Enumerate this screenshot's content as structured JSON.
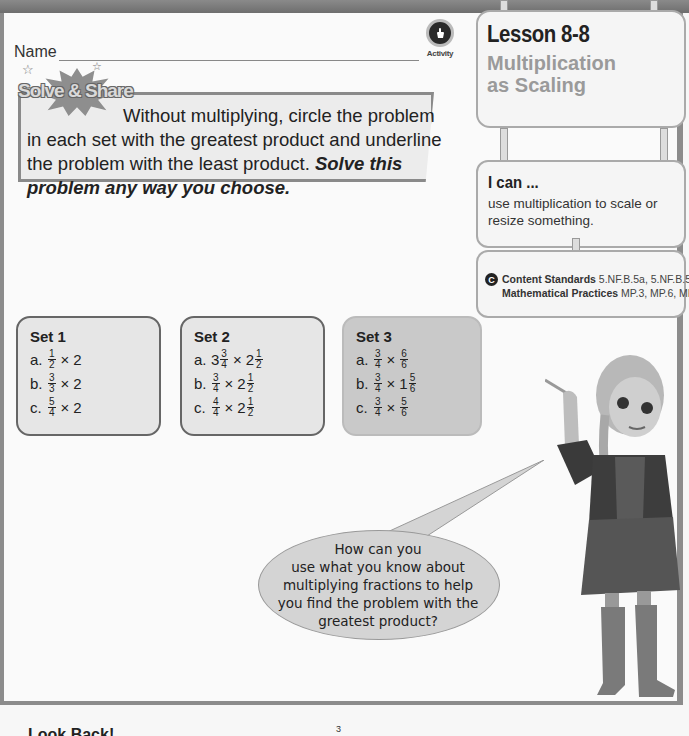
{
  "header": {
    "name_label": "Name",
    "activity_label": "Activity",
    "activity_icon": "hand-pointer-icon"
  },
  "solve_share": {
    "badge": "Solve & Share",
    "prompt_line1": "Without multiplying, circle the problem",
    "prompt_rest": "in each set with the greatest product and underline the problem with the least product.",
    "prompt_bold": "Solve this problem any way you choose."
  },
  "lesson": {
    "number": "Lesson 8-8",
    "title_line1": "Multiplication",
    "title_line2": "as Scaling"
  },
  "i_can": {
    "title": "I can ...",
    "text": "use multiplication to scale or resize something."
  },
  "standards": {
    "icon": "C",
    "content_label": "Content Standards",
    "content_value": "5.NF.B.5a, 5.NF.B.5b",
    "practices_label": "Mathematical Practices",
    "practices_value": "MP.3, MP.6, MP.7"
  },
  "sets": [
    {
      "title": "Set 1",
      "problems": [
        {
          "label": "a.",
          "whole1": "",
          "num1": "1",
          "den1": "2",
          "op": "×",
          "whole2": "2",
          "num2": "",
          "den2": ""
        },
        {
          "label": "b.",
          "whole1": "",
          "num1": "3",
          "den1": "3",
          "op": "×",
          "whole2": "2",
          "num2": "",
          "den2": ""
        },
        {
          "label": "c.",
          "whole1": "",
          "num1": "5",
          "den1": "4",
          "op": "×",
          "whole2": "2",
          "num2": "",
          "den2": ""
        }
      ]
    },
    {
      "title": "Set 2",
      "problems": [
        {
          "label": "a.",
          "whole1": "3",
          "num1": "3",
          "den1": "4",
          "op": "×",
          "whole2": "2",
          "num2": "1",
          "den2": "2"
        },
        {
          "label": "b.",
          "whole1": "",
          "num1": "3",
          "den1": "4",
          "op": "×",
          "whole2": "2",
          "num2": "1",
          "den2": "2"
        },
        {
          "label": "c.",
          "whole1": "",
          "num1": "4",
          "den1": "4",
          "op": "×",
          "whole2": "2",
          "num2": "1",
          "den2": "2"
        }
      ]
    },
    {
      "title": "Set 3",
      "problems": [
        {
          "label": "a.",
          "whole1": "",
          "num1": "3",
          "den1": "4",
          "op": "×",
          "whole2": "",
          "num2": "6",
          "den2": "6"
        },
        {
          "label": "b.",
          "whole1": "",
          "num1": "3",
          "den1": "4",
          "op": "×",
          "whole2": "1",
          "num2": "5",
          "den2": "6"
        },
        {
          "label": "c.",
          "whole1": "",
          "num1": "3",
          "den1": "4",
          "op": "×",
          "whole2": "",
          "num2": "5",
          "den2": "6"
        }
      ]
    }
  ],
  "speech_bubble": {
    "lines": [
      "How can you",
      "use what you know about",
      "multiplying fractions to help",
      "you find the problem with the",
      "greatest product?"
    ]
  },
  "footer": {
    "heading": "Look Back!",
    "superscript": "3"
  }
}
